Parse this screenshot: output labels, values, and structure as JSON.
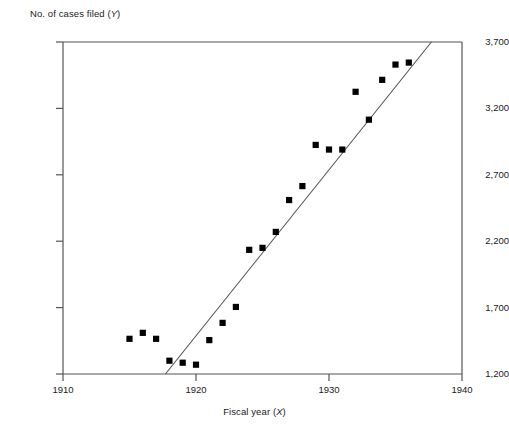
{
  "chart_data": {
    "type": "scatter",
    "title": "",
    "xlabel": "Fiscal year (X)",
    "ylabel": "No. of cases filed (Y)",
    "xlim": [
      1910,
      1940
    ],
    "ylim": [
      1200,
      3700
    ],
    "xticks": [
      1910,
      1920,
      1930,
      1940
    ],
    "xtick_labels": [
      "1910",
      "1920",
      "1930",
      "1940"
    ],
    "yticks": [
      1200,
      1700,
      2200,
      2700,
      3200,
      3700
    ],
    "ytick_labels": [
      "1,200",
      "1,700",
      "2,200",
      "2,700",
      "3,200",
      "3,700"
    ],
    "grid": false,
    "legend": null,
    "marker": "square",
    "marker_color": "#000000",
    "axis_color": "#555555",
    "points": [
      {
        "x": 1915,
        "y": 1465
      },
      {
        "x": 1916,
        "y": 1510
      },
      {
        "x": 1917,
        "y": 1465
      },
      {
        "x": 1918,
        "y": 1300
      },
      {
        "x": 1919,
        "y": 1285
      },
      {
        "x": 1920,
        "y": 1270
      },
      {
        "x": 1921,
        "y": 1455
      },
      {
        "x": 1922,
        "y": 1585
      },
      {
        "x": 1923,
        "y": 1705
      },
      {
        "x": 1924,
        "y": 2135
      },
      {
        "x": 1925,
        "y": 2150
      },
      {
        "x": 1926,
        "y": 2270
      },
      {
        "x": 1927,
        "y": 2510
      },
      {
        "x": 1928,
        "y": 2615
      },
      {
        "x": 1929,
        "y": 2925
      },
      {
        "x": 1930,
        "y": 2890
      },
      {
        "x": 1931,
        "y": 2890
      },
      {
        "x": 1932,
        "y": 3325
      },
      {
        "x": 1933,
        "y": 3115
      },
      {
        "x": 1934,
        "y": 3415
      },
      {
        "x": 1935,
        "y": 3530
      },
      {
        "x": 1936,
        "y": 3545
      }
    ],
    "trend_line": {
      "x_start": 1917.7,
      "y_start": 1200,
      "x_end": 1937.7,
      "y_end": 3700
    }
  }
}
